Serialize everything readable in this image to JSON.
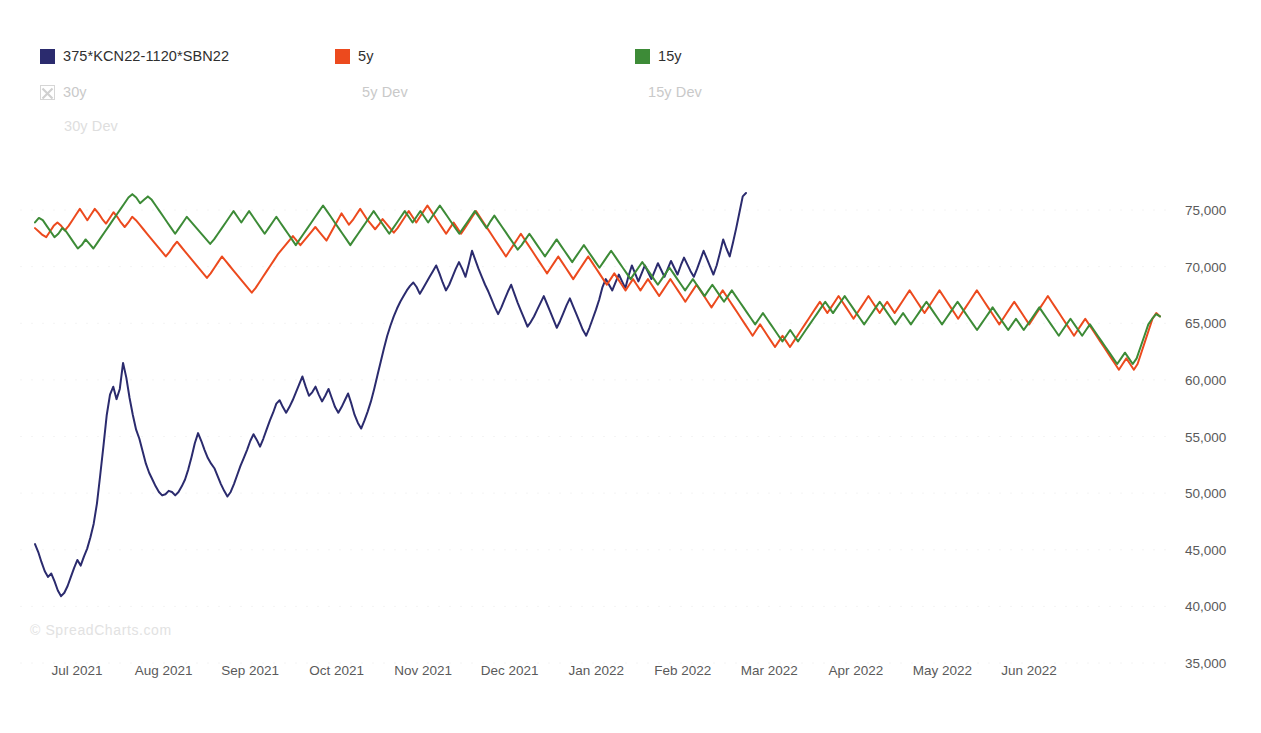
{
  "legend": {
    "items": [
      {
        "label": "375*KCN22-1120*SBN22",
        "color": "#2b2b6e",
        "style": "solid-swatch",
        "state": "active",
        "icon": "color-swatch"
      },
      {
        "label": "5y",
        "color": "#ec4a1e",
        "style": "solid-swatch",
        "state": "active",
        "icon": "color-swatch"
      },
      {
        "label": "15y",
        "color": "#3d8b37",
        "style": "solid-swatch",
        "state": "active",
        "icon": "color-swatch"
      },
      {
        "label": "30y",
        "color": "#c9c9c9",
        "style": "x-box",
        "state": "disabled",
        "icon": "x-box-icon"
      },
      {
        "label": "5y Dev",
        "color": "#c9c9c9",
        "style": "none",
        "state": "disabled",
        "icon": "none"
      },
      {
        "label": "15y Dev",
        "color": "#c9c9c9",
        "style": "none",
        "state": "disabled",
        "icon": "none"
      },
      {
        "label": "30y Dev",
        "color": "#dedede",
        "style": "none",
        "state": "disabled",
        "icon": "none"
      }
    ]
  },
  "watermark": "© SpreadCharts.com",
  "chart_data": {
    "type": "line",
    "title": "",
    "subtitle": "",
    "xlabel": "",
    "ylabel": "",
    "grid": "faint-horizontal",
    "legend_position": "top-left",
    "ylim": [
      35000,
      77500
    ],
    "y_ticks": [
      75000,
      70000,
      65000,
      60000,
      55000,
      50000,
      45000,
      40000,
      35000
    ],
    "y_tick_labels": [
      "75,000",
      "70,000",
      "65,000",
      "60,000",
      "55,000",
      "50,000",
      "45,000",
      "40,000",
      "35,000"
    ],
    "x_ticks": [
      "Jul 2021",
      "Aug 2021",
      "Sep 2021",
      "Oct 2021",
      "Nov 2021",
      "Dec 2021",
      "Jan 2022",
      "Feb 2022",
      "Mar 2022",
      "Apr 2022",
      "May 2022",
      "Jun 2022"
    ],
    "xlim": [
      "Jul 2021",
      "Jul 2022"
    ],
    "series": [
      {
        "name": "375*KCN22-1120*SBN22",
        "color": "#2b2b6e",
        "width": 2.0,
        "x_start_frac": 0.0,
        "x_end_frac": 0.632,
        "values": [
          45500,
          44800,
          43900,
          43100,
          42600,
          42900,
          42200,
          41400,
          40900,
          41200,
          41800,
          42600,
          43400,
          44100,
          43600,
          44400,
          45100,
          46100,
          47300,
          49100,
          51600,
          54200,
          56900,
          58700,
          59400,
          58300,
          59200,
          61500,
          60200,
          58400,
          56900,
          55600,
          54800,
          53700,
          52600,
          51800,
          51200,
          50600,
          50100,
          49800,
          49900,
          50200,
          50100,
          49800,
          50100,
          50600,
          51200,
          52100,
          53200,
          54400,
          55300,
          54600,
          53800,
          53100,
          52600,
          52200,
          51500,
          50800,
          50200,
          49700,
          50100,
          50800,
          51600,
          52400,
          53100,
          53800,
          54600,
          55200,
          54700,
          54100,
          54800,
          55600,
          56400,
          57100,
          57900,
          58200,
          57600,
          57100,
          57600,
          58200,
          58900,
          59600,
          60300,
          59400,
          58600,
          58900,
          59400,
          58700,
          58100,
          58600,
          59200,
          58400,
          57600,
          57100,
          57600,
          58200,
          58800,
          57900,
          56900,
          56200,
          55700,
          56400,
          57200,
          58100,
          59200,
          60400,
          61600,
          62800,
          63900,
          64800,
          65600,
          66300,
          66900,
          67400,
          67900,
          68300,
          68600,
          68200,
          67600,
          68100,
          68600,
          69100,
          69600,
          70100,
          69400,
          68600,
          67900,
          68400,
          69100,
          69800,
          70400,
          69800,
          69100,
          70200,
          71400,
          70600,
          69800,
          69100,
          68400,
          67800,
          67100,
          66400,
          65800,
          66400,
          67100,
          67800,
          68400,
          67600,
          66800,
          66100,
          65400,
          64700,
          65100,
          65600,
          66200,
          66800,
          67400,
          66700,
          66000,
          65300,
          64600,
          65200,
          65900,
          66600,
          67200,
          66500,
          65800,
          65100,
          64400,
          63900,
          64600,
          65400,
          66200,
          67100,
          68200,
          68900,
          68400,
          67900,
          68600,
          69300,
          68700,
          68100,
          69200,
          70100,
          69400,
          68700,
          69400,
          70100,
          69500,
          68900,
          69600,
          70300,
          69700,
          69100,
          69800,
          70500,
          69900,
          69300,
          70100,
          70800,
          70200,
          69600,
          69100,
          69800,
          70600,
          71400,
          70700,
          70000,
          69300,
          70100,
          71200,
          72400,
          71600,
          70900,
          72100,
          73400,
          74800,
          76200,
          76500
        ]
      },
      {
        "name": "5y",
        "color": "#ec4a1e",
        "width": 2.0,
        "x_start_frac": 0.0,
        "x_end_frac": 1.0,
        "values": [
          73400,
          73100,
          72800,
          72600,
          73100,
          73600,
          73900,
          73600,
          73200,
          73600,
          74100,
          74600,
          75100,
          74600,
          74100,
          74600,
          75100,
          74700,
          74200,
          73800,
          74300,
          74800,
          74400,
          73900,
          73500,
          73900,
          74400,
          74100,
          73700,
          73300,
          72900,
          72500,
          72100,
          71700,
          71300,
          70900,
          71300,
          71800,
          72200,
          71800,
          71400,
          71000,
          70600,
          70200,
          69800,
          69400,
          69000,
          69400,
          69900,
          70400,
          70900,
          70500,
          70100,
          69700,
          69300,
          68900,
          68500,
          68100,
          67700,
          68100,
          68600,
          69100,
          69600,
          70100,
          70600,
          71100,
          71500,
          71900,
          72300,
          72700,
          72300,
          71900,
          72300,
          72700,
          73100,
          73500,
          73100,
          72700,
          72300,
          72900,
          73500,
          74100,
          74700,
          74200,
          73700,
          74100,
          74600,
          75100,
          74600,
          74100,
          73700,
          73300,
          73700,
          74200,
          73800,
          73400,
          73000,
          73400,
          73900,
          74400,
          74900,
          74400,
          73900,
          74400,
          74900,
          75400,
          74900,
          74400,
          73900,
          73400,
          72900,
          73400,
          73900,
          73400,
          72900,
          73400,
          73900,
          74400,
          74900,
          74400,
          73900,
          73400,
          72900,
          72400,
          71900,
          71400,
          70900,
          71400,
          71900,
          72400,
          72900,
          72400,
          71900,
          71400,
          70900,
          70400,
          69900,
          69400,
          69900,
          70400,
          70900,
          70400,
          69900,
          69400,
          68900,
          69400,
          69900,
          70400,
          70900,
          70400,
          69900,
          69400,
          68900,
          68400,
          68900,
          69400,
          68900,
          68400,
          67900,
          68400,
          68900,
          68400,
          67900,
          68400,
          68900,
          68400,
          67900,
          67400,
          67900,
          68400,
          68900,
          68400,
          67900,
          67400,
          66900,
          67400,
          67900,
          68400,
          67900,
          67400,
          66900,
          66400,
          66900,
          67400,
          67900,
          67400,
          66900,
          66400,
          65900,
          65400,
          64900,
          64400,
          63900,
          64400,
          64900,
          64400,
          63900,
          63400,
          62900,
          63400,
          63900,
          63400,
          62900,
          63400,
          63900,
          64400,
          64900,
          65400,
          65900,
          66400,
          66900,
          66400,
          65900,
          66400,
          66900,
          67400,
          66900,
          66400,
          65900,
          65400,
          65900,
          66400,
          66900,
          67400,
          66900,
          66400,
          65900,
          66400,
          66900,
          66400,
          65900,
          66400,
          66900,
          67400,
          67900,
          67400,
          66900,
          66400,
          65900,
          66400,
          66900,
          67400,
          67900,
          67400,
          66900,
          66400,
          65900,
          65400,
          65900,
          66400,
          66900,
          67400,
          67900,
          67400,
          66900,
          66400,
          65900,
          65400,
          64900,
          65400,
          65900,
          66400,
          66900,
          66400,
          65900,
          65400,
          64900,
          65400,
          65900,
          66400,
          66900,
          67400,
          66900,
          66400,
          65900,
          65400,
          64900,
          64400,
          63900,
          64400,
          64900,
          65400,
          64900,
          64400,
          63900,
          63400,
          62900,
          62400,
          61900,
          61400,
          60900,
          61400,
          61900,
          61400,
          60900,
          61400,
          62400,
          63400,
          64400,
          65400,
          65900,
          65600
        ]
      },
      {
        "name": "15y",
        "color": "#3d8b37",
        "width": 2.0,
        "x_start_frac": 0.0,
        "x_end_frac": 1.0,
        "values": [
          73900,
          74300,
          74100,
          73600,
          73100,
          72600,
          72900,
          73400,
          73100,
          72600,
          72100,
          71600,
          71900,
          72400,
          72000,
          71600,
          72100,
          72600,
          73100,
          73600,
          74100,
          74600,
          75100,
          75600,
          76100,
          76400,
          76100,
          75600,
          75900,
          76200,
          75900,
          75400,
          74900,
          74400,
          73900,
          73400,
          72900,
          73400,
          73900,
          74400,
          74000,
          73600,
          73200,
          72800,
          72400,
          72000,
          72400,
          72900,
          73400,
          73900,
          74400,
          74900,
          74400,
          73900,
          74400,
          74900,
          74400,
          73900,
          73400,
          72900,
          73400,
          73900,
          74400,
          73900,
          73400,
          72900,
          72400,
          71900,
          72400,
          72900,
          73400,
          73900,
          74400,
          74900,
          75400,
          74900,
          74400,
          73900,
          73400,
          72900,
          72400,
          71900,
          72400,
          72900,
          73400,
          73900,
          74400,
          74900,
          74400,
          73900,
          73400,
          72900,
          73400,
          73900,
          74400,
          74900,
          74400,
          73900,
          74400,
          74900,
          74400,
          73900,
          74400,
          74900,
          75400,
          74900,
          74400,
          73900,
          73400,
          72900,
          73400,
          73900,
          74400,
          74900,
          74400,
          73900,
          73400,
          74000,
          74500,
          74000,
          73500,
          73000,
          72500,
          72000,
          71500,
          71900,
          72400,
          72900,
          72400,
          71900,
          71400,
          70900,
          71400,
          71900,
          72400,
          71900,
          71400,
          70900,
          70400,
          70900,
          71400,
          71900,
          71400,
          70900,
          70400,
          69900,
          70400,
          70900,
          71400,
          70900,
          70400,
          69900,
          69400,
          68900,
          69400,
          69900,
          70400,
          69900,
          69400,
          68900,
          68400,
          68900,
          69400,
          69900,
          69400,
          68900,
          68400,
          67900,
          68400,
          68900,
          68400,
          67900,
          67400,
          67900,
          68400,
          67900,
          67400,
          66900,
          67400,
          67900,
          67400,
          66900,
          66400,
          65900,
          65400,
          64900,
          65400,
          65900,
          65400,
          64900,
          64400,
          63900,
          63400,
          63900,
          64400,
          63900,
          63400,
          63900,
          64400,
          64900,
          65400,
          65900,
          66400,
          66900,
          66400,
          65900,
          66400,
          66900,
          67400,
          66900,
          66400,
          65900,
          65400,
          64900,
          65400,
          65900,
          66400,
          66900,
          66400,
          65900,
          65400,
          64900,
          65400,
          65900,
          65400,
          64900,
          65400,
          65900,
          66400,
          66900,
          66400,
          65900,
          65400,
          64900,
          65400,
          65900,
          66400,
          66900,
          66400,
          65900,
          65400,
          64900,
          64400,
          64900,
          65400,
          65900,
          66400,
          65900,
          65400,
          64900,
          64400,
          64900,
          65400,
          64900,
          64400,
          64900,
          65400,
          65900,
          66400,
          65900,
          65400,
          64900,
          64400,
          63900,
          64400,
          64900,
          65400,
          64900,
          64400,
          63900,
          64400,
          64900,
          64400,
          63900,
          63400,
          62900,
          62400,
          61900,
          61400,
          61900,
          62400,
          61900,
          61400,
          61900,
          62900,
          63900,
          64900,
          65400,
          65800,
          65600
        ]
      }
    ]
  }
}
